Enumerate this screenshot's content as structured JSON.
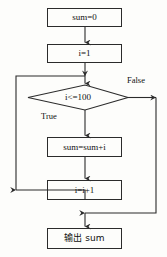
{
  "diagram": {
    "type": "flowchart",
    "title_visible": false,
    "background_color": "#fdfdfb",
    "stroke_color": "#2b2b2b",
    "text_color": "#111111",
    "nodes": [
      {
        "id": "init_sum",
        "shape": "process",
        "label": "sum=0",
        "x": 47,
        "y": 8,
        "w": 75,
        "h": 19
      },
      {
        "id": "init_i",
        "shape": "process",
        "label": "i=1",
        "x": 47,
        "y": 44,
        "w": 75,
        "h": 19
      },
      {
        "id": "condition",
        "shape": "decision",
        "label": "i<=100",
        "x": 28,
        "y": 85,
        "w": 100,
        "h": 25
      },
      {
        "id": "accumulate",
        "shape": "process",
        "label": "sum=sum+i",
        "x": 47,
        "y": 137,
        "w": 75,
        "h": 20
      },
      {
        "id": "increment",
        "shape": "process",
        "label": "i=i+1",
        "x": 47,
        "y": 180,
        "w": 75,
        "h": 20
      },
      {
        "id": "output",
        "shape": "process",
        "label": "输出 sum",
        "x": 47,
        "y": 228,
        "w": 75,
        "h": 21
      }
    ],
    "edge_labels": [
      {
        "id": "true_label",
        "text": "True",
        "x": 41,
        "y": 112
      },
      {
        "id": "false_label",
        "text": "False",
        "x": 127,
        "y": 76
      }
    ],
    "edges": [
      {
        "from": "init_sum",
        "to": "init_i",
        "label": ""
      },
      {
        "from": "init_i",
        "to": "condition",
        "label": ""
      },
      {
        "from": "condition",
        "to": "accumulate",
        "label": "True"
      },
      {
        "from": "condition",
        "to": "output",
        "label": "False"
      },
      {
        "from": "accumulate",
        "to": "increment",
        "label": ""
      },
      {
        "from": "increment",
        "to": "condition",
        "label": ""
      }
    ]
  }
}
